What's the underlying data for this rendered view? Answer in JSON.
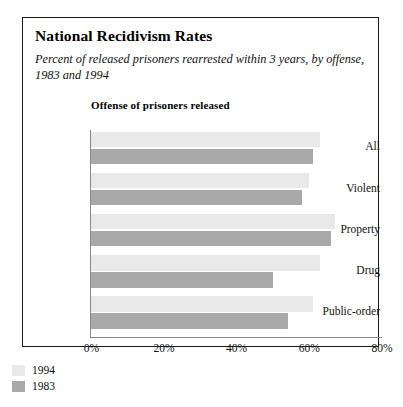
{
  "page_header": "",
  "figure": {
    "title": "National Recidivism Rates",
    "subtitle": "Percent of released prisoners rearrested within 3 years, by offense, 1983 and 1994",
    "plot_heading": "Offense of prisoners released"
  },
  "legend": {
    "items": [
      {
        "label": "1994",
        "color": "#e9e9e9"
      },
      {
        "label": "1983",
        "color": "#a9a9a9"
      }
    ]
  },
  "chart_data": {
    "type": "bar",
    "orientation": "horizontal",
    "title": "National Recidivism Rates",
    "subtitle": "Percent of released prisoners rearrested within 3 years, by offense, 1983 and 1994",
    "xlabel": "",
    "ylabel": "Offense of prisoners released",
    "xlim": [
      0,
      80
    ],
    "xticks": [
      0,
      20,
      40,
      60,
      80
    ],
    "xtick_labels": [
      "0%",
      "20%",
      "40%",
      "60%",
      "80%"
    ],
    "grid": false,
    "legend_position": "below-left",
    "categories": [
      "All",
      "Violent",
      "Property",
      "Drug",
      "Public-order"
    ],
    "series": [
      {
        "name": "1994",
        "color": "#e9e9e9",
        "values": [
          63,
          60,
          67,
          63,
          61
        ]
      },
      {
        "name": "1983",
        "color": "#a9a9a9",
        "values": [
          61,
          58,
          66,
          50,
          54
        ]
      }
    ]
  }
}
